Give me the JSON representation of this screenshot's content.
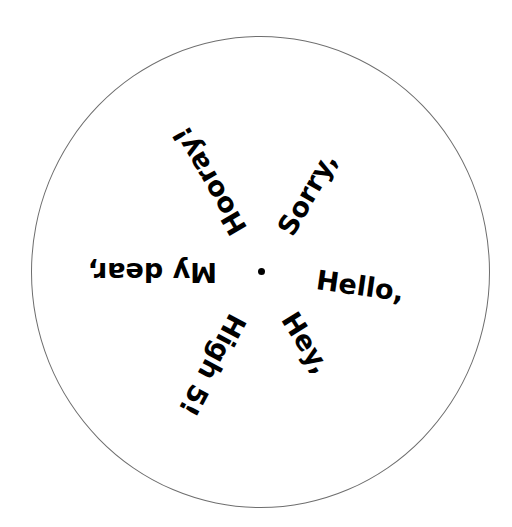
{
  "dial": {
    "words": [
      {
        "label": "Hello,",
        "angle_deg": 8
      },
      {
        "label": "Hey,",
        "angle_deg": 58
      },
      {
        "label": "High 5!",
        "angle_deg": 118
      },
      {
        "label": "My dear,",
        "angle_deg": 180
      },
      {
        "label": "Hooray!",
        "angle_deg": 240
      },
      {
        "label": "Sorry,",
        "angle_deg": 300
      }
    ]
  }
}
